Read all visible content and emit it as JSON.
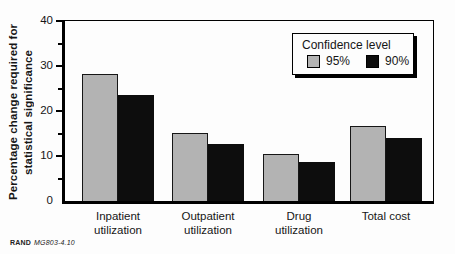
{
  "chart_data": {
    "type": "bar",
    "title": "",
    "xlabel": "",
    "ylabel": "Percentage change required for\nstatistical significance",
    "categories": [
      "Inpatient\nutilization",
      "Outpatient\nutilization",
      "Drug\nutilization",
      "Total cost"
    ],
    "series": [
      {
        "name": "95%",
        "color": "#b3b3b3",
        "values": [
          28.3,
          15.0,
          10.5,
          16.7
        ]
      },
      {
        "name": "90%",
        "color": "#0d0d0d",
        "values": [
          23.5,
          12.6,
          8.6,
          14.1
        ]
      }
    ],
    "ylim": [
      0,
      40
    ],
    "yticks": [
      0,
      10,
      20,
      30,
      40
    ],
    "minor_yticks": [
      5,
      15,
      25,
      35
    ],
    "grid": false,
    "legend_position": "top-right"
  },
  "legend": {
    "title": "Confidence level",
    "items": [
      {
        "label": "95%",
        "color": "#b3b3b3"
      },
      {
        "label": "90%",
        "color": "#0d0d0d"
      }
    ]
  },
  "footer": {
    "brand": "RAND",
    "doc_id": "MG803-4.10"
  }
}
